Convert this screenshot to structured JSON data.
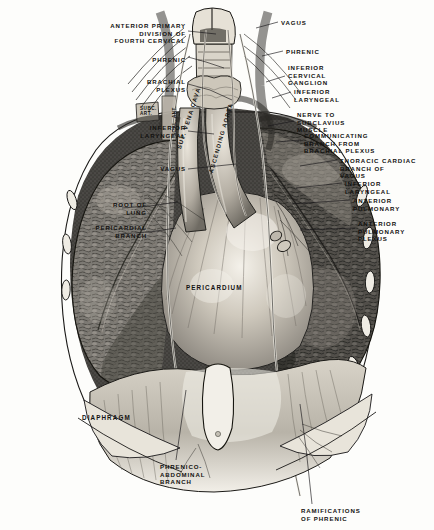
{
  "plate": {
    "title": "Anterior view of thorax showing phrenic and vagus nerves",
    "background_color": "#fdfdfb",
    "ink_color": "#12110f"
  },
  "labels_left": [
    {
      "id": "anterior-primary-division-fourth-cervical",
      "text": "ANTERIOR PRIMARY\nDIVISION OF\nFOURTH CERVICAL",
      "x": 64,
      "y": 22,
      "align": "right",
      "width": 122
    },
    {
      "id": "phrenic-left",
      "text": "PHRENIC",
      "x": 96,
      "y": 56,
      "align": "right",
      "width": 90
    },
    {
      "id": "brachial-plexus",
      "text": "BRACHIAL\nPLEXUS",
      "x": 86,
      "y": 78,
      "align": "right",
      "width": 100
    },
    {
      "id": "inferior-laryngeal-left",
      "text": "INFERIOR\nLARYNGEAL",
      "x": 72,
      "y": 124,
      "align": "right",
      "width": 114
    },
    {
      "id": "vagus-left",
      "text": "VAGUS",
      "x": 76,
      "y": 165,
      "align": "right",
      "width": 110
    },
    {
      "id": "root-of-lung",
      "text": "ROOT OF\nLUNG",
      "x": 42,
      "y": 201,
      "align": "right",
      "width": 105
    },
    {
      "id": "pericardial-branch",
      "text": "PERICARDIAL\nBRANCH",
      "x": 22,
      "y": 224,
      "align": "right",
      "width": 125
    }
  ],
  "labels_right": [
    {
      "id": "vagus-right",
      "text": "VAGUS",
      "x": 281,
      "y": 19,
      "align": "left"
    },
    {
      "id": "phrenic-right",
      "text": "PHRENIC",
      "x": 286,
      "y": 48,
      "align": "left"
    },
    {
      "id": "inferior-cervical-ganglion",
      "text": "INFERIOR\nCERVICAL\nGANGLION",
      "x": 288,
      "y": 64,
      "align": "left"
    },
    {
      "id": "inferior-laryngeal-right",
      "text": "INFERIOR\nLARYNGEAL",
      "x": 294,
      "y": 88,
      "align": "left"
    },
    {
      "id": "nerve-to-subclavius-muscle",
      "text": "NERVE TO\nSUBCLAVIUS\nMUSCLE",
      "x": 297,
      "y": 111,
      "align": "left"
    },
    {
      "id": "communicating-branch-from-brachial-plexus",
      "text": "COMMUNICATING\nBRANCH FROM\nBRACHIAL PLEXUS",
      "x": 304,
      "y": 132,
      "align": "left"
    },
    {
      "id": "thoracic-cardiac-branch-of-vagus",
      "text": "THORACIC CARDIAC\nBRANCH OF\nVAGUS",
      "x": 340,
      "y": 157,
      "align": "left"
    },
    {
      "id": "inferior-laryngeal-right-2",
      "text": "INFERIOR\nLARYNGEAL",
      "x": 345,
      "y": 180,
      "align": "left"
    },
    {
      "id": "anterior-pulmonary",
      "text": "ANTERIOR\nPULMONARY",
      "x": 353,
      "y": 197,
      "align": "left"
    },
    {
      "id": "anterior-pulmonary-plexus",
      "text": "ANTERIOR\nPULMONARY\nPLEXUS",
      "x": 358,
      "y": 220,
      "align": "left"
    }
  ],
  "labels_bottom": [
    {
      "id": "phrenico-abdominal-branch",
      "text": "PHRENICO-\nABDOMINAL\nBRANCH",
      "x": 160,
      "y": 463,
      "align": "left"
    },
    {
      "id": "ramifications-of-phrenic",
      "text": "RAMIFICATIONS\nOF PHRENIC",
      "x": 301,
      "y": 507,
      "align": "left"
    }
  ],
  "labels_in_figure": [
    {
      "id": "sup-vena-cava",
      "text": "SUP. VENA CAVA",
      "x": 176,
      "y": 148,
      "rotation": -72,
      "size": 6.0
    },
    {
      "id": "ascending-aorta",
      "text": "ASCENDING AORTA",
      "x": 208,
      "y": 172,
      "rotation": -74,
      "size": 5.8
    },
    {
      "id": "pericardium",
      "text": "PERICARDIUM",
      "x": 186,
      "y": 284,
      "rotation": 0,
      "size": 6.3
    },
    {
      "id": "diaphragm",
      "text": "DIAPHRAGM",
      "x": 82,
      "y": 414,
      "rotation": 0,
      "size": 6.3
    },
    {
      "id": "subclavian-artery-abbrev",
      "text": "SUBC.\nART.",
      "x": 140,
      "y": 109,
      "rotation": 0,
      "size": 4.6
    },
    {
      "id": "scalenus-anterior-abbrev",
      "text": "SCAL. ANT.",
      "x": 166,
      "y": 133,
      "rotation": -90,
      "size": 4.6
    }
  ],
  "anatomy": {
    "structures": [
      "larynx",
      "thyroid-gland",
      "trachea",
      "right-lung",
      "left-lung",
      "pericardium",
      "heart",
      "diaphragm",
      "superior-vena-cava",
      "ascending-aorta",
      "ribs",
      "phrenic-nerve",
      "vagus-nerve",
      "brachial-plexus",
      "xiphoid-process"
    ]
  }
}
